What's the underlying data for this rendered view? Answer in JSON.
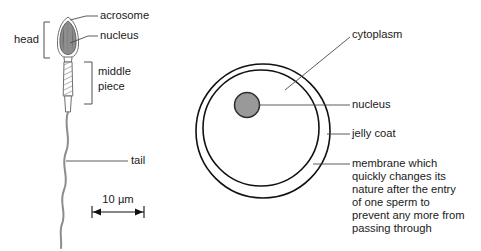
{
  "figure": {
    "background_color": "#ffffff"
  },
  "colors": {
    "outline_dark": "#111111",
    "leader_line": "#4a4a4a",
    "sperm_outline": "#6f6f6f",
    "nucleus_fill": "#999999",
    "acrosome_fill": "#8f8f8f",
    "text": "#1a1a1a",
    "tail": "#8d8d8d"
  },
  "sperm": {
    "labels": {
      "head": "head",
      "acrosome": "acrosome",
      "nucleus": "nucleus",
      "middle_piece_line1": "middle",
      "middle_piece_line2": "piece",
      "tail": "tail"
    },
    "scale_bar": {
      "value": "10 µm"
    }
  },
  "egg": {
    "labels": {
      "cytoplasm": "cytoplasm",
      "nucleus": "nucleus",
      "jelly_coat": "jelly coat",
      "membrane_line1": "membrane which",
      "membrane_line2": "quickly changes its",
      "membrane_line3": "nature after the entry",
      "membrane_line4": "of one sperm to",
      "membrane_line5": "prevent any more from",
      "membrane_line6": "passing through"
    }
  }
}
